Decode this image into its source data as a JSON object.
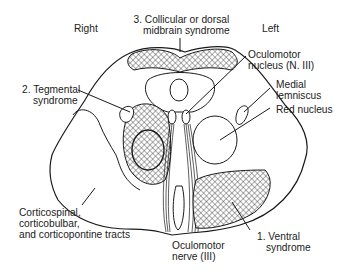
{
  "figure": {
    "orientation": {
      "right": "Right",
      "left": "Left"
    },
    "labels": {
      "collicular": {
        "line1": "3. Collicular or dorsal",
        "line2": "midbrain syndrome"
      },
      "oculomotor_nucleus": {
        "line1": "Oculomotor",
        "line2": "nucleus (N. III)"
      },
      "tegmental": {
        "line1": "2. Tegmental",
        "line2": "syndrome"
      },
      "medial_lemniscus": {
        "line1": "Medial",
        "line2": "lemniscus"
      },
      "red_nucleus": {
        "line1": "Red nucleus"
      },
      "corticospinal": {
        "line1": "Corticospinal,",
        "line2": "corticobulbar,",
        "line3": "and corticopontine tracts"
      },
      "oculomotor_nerve": {
        "line1": "Oculomotor",
        "line2": "nerve (III)"
      },
      "ventral": {
        "line1": "1. Ventral",
        "line2": "syndrome"
      }
    },
    "colors": {
      "stroke": "#1a1a1a",
      "hatch": "#333333",
      "background": "#ffffff"
    }
  }
}
